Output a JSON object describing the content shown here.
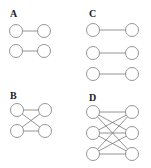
{
  "diagram": {
    "colors": {
      "node_stroke": "#8a8a8a",
      "edge": "#7a7a7a",
      "label": "#222222",
      "background": "#ffffff"
    },
    "panels": [
      {
        "label": "A",
        "label_pos": [
          10,
          17
        ],
        "nodes": [
          [
            16,
            31
          ],
          [
            44,
            31
          ],
          [
            16,
            51
          ],
          [
            44,
            51
          ]
        ],
        "edges": [
          [
            0,
            1
          ],
          [
            2,
            3
          ]
        ]
      },
      {
        "label": "C",
        "label_pos": [
          89,
          17
        ],
        "nodes": [
          [
            93,
            30
          ],
          [
            132,
            30
          ],
          [
            93,
            53
          ],
          [
            132,
            53
          ],
          [
            93,
            74
          ],
          [
            132,
            74
          ]
        ],
        "edges": [
          [
            0,
            1
          ],
          [
            2,
            3
          ],
          [
            4,
            5
          ]
        ]
      },
      {
        "label": "B",
        "label_pos": [
          10,
          99
        ],
        "nodes": [
          [
            17,
            110
          ],
          [
            45,
            110
          ],
          [
            17,
            131
          ],
          [
            45,
            131
          ]
        ],
        "edges": [
          [
            0,
            1
          ],
          [
            2,
            3
          ],
          [
            0,
            3
          ],
          [
            2,
            1
          ]
        ]
      },
      {
        "label": "D",
        "label_pos": [
          89,
          101
        ],
        "nodes": [
          [
            93,
            112
          ],
          [
            132,
            112
          ],
          [
            93,
            133
          ],
          [
            132,
            133
          ],
          [
            93,
            154
          ],
          [
            132,
            154
          ]
        ],
        "edges": [
          [
            0,
            1
          ],
          [
            0,
            3
          ],
          [
            0,
            5
          ],
          [
            2,
            1
          ],
          [
            2,
            3
          ],
          [
            2,
            5
          ],
          [
            4,
            1
          ],
          [
            4,
            3
          ],
          [
            4,
            5
          ]
        ]
      }
    ],
    "node_radius": 6.5
  }
}
